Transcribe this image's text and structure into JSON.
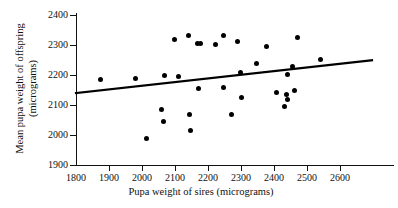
{
  "chart_data": {
    "type": "scatter",
    "title": "",
    "xlabel": "Pupa weight of sires (micrograms)",
    "ylabel_line1": "Mean pupa weight of offspring",
    "ylabel_line2": "(micrograms)",
    "xlim": [
      1800,
      2700
    ],
    "ylim": [
      1900,
      2400
    ],
    "xticks": [
      1800,
      1900,
      2000,
      2100,
      2200,
      2300,
      2400,
      2500,
      2600
    ],
    "yticks": [
      1900,
      2000,
      2100,
      2200,
      2300,
      2400
    ],
    "grid": false,
    "legend": null,
    "marker_color": "#000000",
    "line_color": "#000000",
    "points": [
      {
        "x": 1875,
        "y": 2185
      },
      {
        "x": 1980,
        "y": 2187
      },
      {
        "x": 2015,
        "y": 1989
      },
      {
        "x": 2060,
        "y": 2084
      },
      {
        "x": 2065,
        "y": 2044
      },
      {
        "x": 2068,
        "y": 2198
      },
      {
        "x": 2098,
        "y": 2320
      },
      {
        "x": 2110,
        "y": 2195
      },
      {
        "x": 2140,
        "y": 2333
      },
      {
        "x": 2143,
        "y": 2069
      },
      {
        "x": 2147,
        "y": 2016
      },
      {
        "x": 2168,
        "y": 2305
      },
      {
        "x": 2178,
        "y": 2305
      },
      {
        "x": 2172,
        "y": 2154
      },
      {
        "x": 2222,
        "y": 2301
      },
      {
        "x": 2248,
        "y": 2331
      },
      {
        "x": 2246,
        "y": 2159
      },
      {
        "x": 2272,
        "y": 2068
      },
      {
        "x": 2290,
        "y": 2311
      },
      {
        "x": 2298,
        "y": 2210
      },
      {
        "x": 2303,
        "y": 2126
      },
      {
        "x": 2348,
        "y": 2239
      },
      {
        "x": 2378,
        "y": 2296
      },
      {
        "x": 2408,
        "y": 2142
      },
      {
        "x": 2432,
        "y": 2095
      },
      {
        "x": 2437,
        "y": 2136
      },
      {
        "x": 2440,
        "y": 2201
      },
      {
        "x": 2442,
        "y": 2120
      },
      {
        "x": 2455,
        "y": 2227
      },
      {
        "x": 2462,
        "y": 2148
      },
      {
        "x": 2470,
        "y": 2324
      },
      {
        "x": 2540,
        "y": 2253
      }
    ],
    "fit_line": {
      "x_start": 1800,
      "y_start": 2140,
      "x_end": 2697,
      "y_end": 2249
    }
  }
}
